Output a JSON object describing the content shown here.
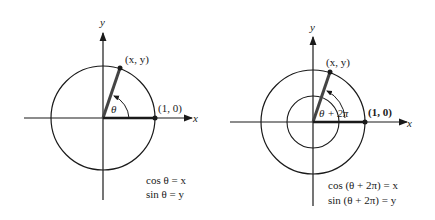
{
  "left_figure": {
    "y_axis_label": "y",
    "x_axis_label": "x",
    "point_label": "(x, y)",
    "unit_point_label": "(1, 0)",
    "angle_label": "θ",
    "equation_1": "cos θ = x",
    "equation_2": "sin θ = y"
  },
  "right_figure": {
    "y_axis_label": "y",
    "x_axis_label": "x",
    "point_label": "(x, y)",
    "unit_point_label": "(1, 0)",
    "angle_label": "θ + 2π",
    "equation_1": "cos (θ + 2π) = x",
    "equation_2": "sin (θ + 2π) = y"
  },
  "colors": {
    "ink": "#1a1a1a",
    "radius": "#444444",
    "background": "#ffffff"
  }
}
